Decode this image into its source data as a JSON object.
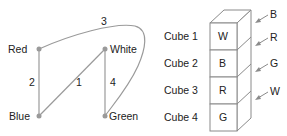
{
  "graph": {
    "nodes": [
      {
        "id": "red",
        "label": "Red",
        "x": 39,
        "y": 49,
        "label_x": 5,
        "label_y": 53
      },
      {
        "id": "white",
        "label": "White",
        "x": 105,
        "y": 49,
        "label_x": 110,
        "label_y": 53
      },
      {
        "id": "blue",
        "label": "Blue",
        "x": 39,
        "y": 116,
        "label_x": 8,
        "label_y": 120
      },
      {
        "id": "green",
        "label": "Green",
        "x": 105,
        "y": 116,
        "label_x": 108,
        "label_y": 120
      }
    ],
    "edges": [
      {
        "label": "1",
        "from": "blue",
        "to": "white",
        "label_x": 76,
        "label_y": 86
      },
      {
        "label": "2",
        "from": "red",
        "to": "blue",
        "label_x": 29,
        "label_y": 86
      },
      {
        "label": "3",
        "from": "red",
        "to": "green",
        "curved": true,
        "label_x": 101,
        "label_y": 25
      },
      {
        "label": "4",
        "from": "white",
        "to": "green",
        "label_x": 110,
        "label_y": 86
      }
    ]
  },
  "cubes": {
    "items": [
      {
        "name": "Cube 1",
        "front": "W"
      },
      {
        "name": "Cube 2",
        "front": "B"
      },
      {
        "name": "Cube 3",
        "front": "R"
      },
      {
        "name": "Cube 4",
        "front": "G"
      }
    ],
    "side_labels": [
      "B",
      "R",
      "G",
      "W"
    ]
  }
}
